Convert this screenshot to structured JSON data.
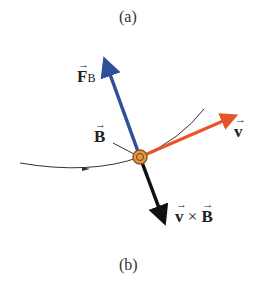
{
  "captions": {
    "top": "(a)",
    "bottom": "(b)"
  },
  "labels": {
    "force": {
      "symbol": "F",
      "subscript": "B"
    },
    "field": {
      "symbol": "B"
    },
    "velocity": {
      "symbol": "v"
    },
    "cross": {
      "left": "v",
      "op": " × ",
      "right": "B"
    }
  },
  "colors": {
    "force_arrow": "#2f4f9a",
    "velocity_arrow": "#e8542a",
    "cross_arrow": "#111111",
    "particle": "#d9823a",
    "path": "#333333"
  }
}
